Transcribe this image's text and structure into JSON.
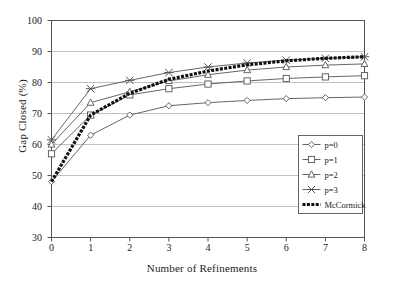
{
  "chart_data": {
    "type": "line",
    "title": "",
    "xlabel": "Number of Refinements",
    "ylabel": "Gap Closed (%)",
    "x": [
      0,
      1,
      2,
      3,
      4,
      5,
      6,
      7,
      8
    ],
    "xlim": [
      0,
      8
    ],
    "ylim": [
      30,
      100
    ],
    "yticks": [
      30,
      40,
      50,
      60,
      70,
      80,
      90,
      100
    ],
    "xticks": [
      0,
      1,
      2,
      3,
      4,
      5,
      6,
      7,
      8
    ],
    "grid": "horizontal",
    "legend_position": "bottom-right",
    "series": [
      {
        "name": "p=0",
        "marker": "diamond",
        "values": [
          48.0,
          63.0,
          69.5,
          72.5,
          73.5,
          74.2,
          74.8,
          75.1,
          75.3
        ]
      },
      {
        "name": "p=1",
        "marker": "square",
        "values": [
          57.0,
          69.5,
          76.0,
          78.0,
          79.5,
          80.5,
          81.3,
          81.8,
          82.2
        ]
      },
      {
        "name": "p=2",
        "marker": "triangle",
        "values": [
          60.0,
          73.5,
          77.0,
          80.5,
          82.5,
          84.0,
          85.0,
          85.6,
          86.0
        ]
      },
      {
        "name": "p=3",
        "marker": "cross",
        "values": [
          61.5,
          78.0,
          80.7,
          83.2,
          85.0,
          86.3,
          87.2,
          87.8,
          88.3
        ]
      },
      {
        "name": "McCormick",
        "marker": "none",
        "values": [
          48.0,
          69.5,
          76.5,
          81.0,
          83.7,
          85.7,
          87.0,
          87.8,
          88.3
        ]
      }
    ]
  },
  "axes": {
    "ytick_labels": [
      "100",
      "90",
      "80",
      "70",
      "60",
      "50",
      "40",
      "30"
    ],
    "xtick_labels": [
      "0",
      "1",
      "2",
      "3",
      "4",
      "5",
      "6",
      "7",
      "8"
    ],
    "y_axis_title": "Gap Closed (%)",
    "x_axis_title": "Number of Refinements"
  },
  "legend": {
    "entries": [
      {
        "label": "p=0",
        "marker": "diamond-icon"
      },
      {
        "label": "p=1",
        "marker": "square-icon"
      },
      {
        "label": "p=2",
        "marker": "triangle-icon"
      },
      {
        "label": "p=3",
        "marker": "cross-icon"
      },
      {
        "label": "McCormick",
        "marker": "thick-dashed-line-icon"
      }
    ]
  },
  "colors": {
    "line": "#555555",
    "mccormick": "#111111",
    "grid": "#b9b9b9",
    "frame": "#555555",
    "background": "#ffffff"
  }
}
